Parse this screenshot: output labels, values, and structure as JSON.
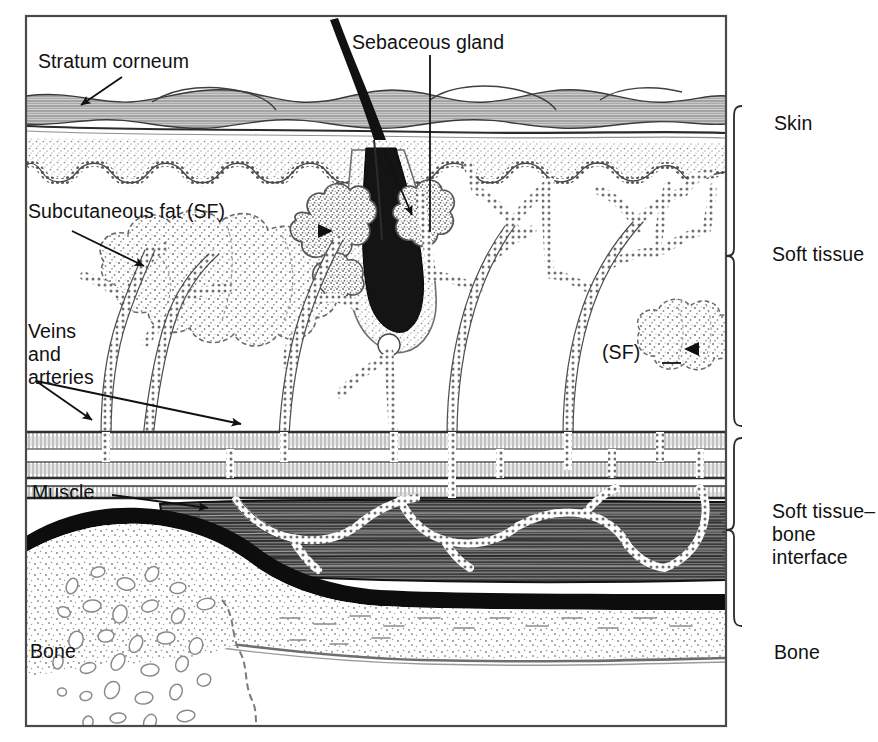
{
  "figure": {
    "frame_color": "#4a4a4a",
    "ink_color": "#111111",
    "background": "#ffffff"
  },
  "labels": {
    "stratum_corneum": "Stratum corneum",
    "sebaceous_gland": "Sebaceous gland",
    "subcutaneous_fat": "Subcutaneous fat (SF)",
    "veins_and_arteries": "Veins\nand\narteries",
    "sf_abbrev": "(SF)",
    "muscle": "Muscle",
    "bone_left": "Bone"
  },
  "brackets": [
    {
      "id": "skin",
      "label": "Skin"
    },
    {
      "id": "soft-tissue",
      "label": "Soft tissue"
    },
    {
      "id": "soft-tissue-bone",
      "label": "Soft tissue–\nbone\ninterface"
    },
    {
      "id": "bone",
      "label": "Bone"
    }
  ],
  "bracket_labels": {
    "skin": "Skin",
    "soft_tissue": "Soft tissue",
    "soft_tissue_bone_interface": "Soft tissue–\nbone\ninterface",
    "bone": "Bone"
  },
  "structures": [
    "stratum-corneum",
    "epidermis",
    "dermis",
    "hair-shaft",
    "hair-follicle",
    "sebaceous-gland",
    "subcutaneous-fat",
    "veins-and-arteries",
    "fascia",
    "muscle",
    "cortical-bone",
    "trabecular-bone"
  ]
}
